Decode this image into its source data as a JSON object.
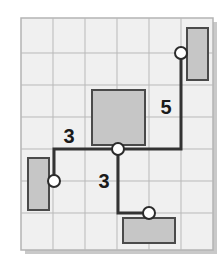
{
  "figure": {
    "type": "diagram",
    "width": 223,
    "height": 257
  },
  "colors": {
    "page_background": "#ffffff",
    "panel_background": "#f0f0f0",
    "panel_border": "#b4b4b4",
    "panel_shadow": "#c9c9c9",
    "grid_line": "#b9b9b9",
    "block_fill": "#c6c6c6",
    "block_border": "#4a4a4a",
    "path_stroke": "#333333",
    "node_fill": "#ffffff",
    "node_border": "#2b2b2b",
    "label_text": "#1a1a1a"
  },
  "panel": {
    "x": 21,
    "y": 18,
    "width": 192,
    "height": 232,
    "shadow_offset": 4
  },
  "grid": {
    "visible": true,
    "spacing": 32,
    "vertical_lines": [
      53,
      85,
      117,
      149,
      181
    ],
    "horizontal_lines": [
      53,
      85,
      117,
      149,
      181,
      213
    ]
  },
  "blocks": [
    {
      "name": "block-top-right",
      "x": 187,
      "y": 28,
      "width": 21,
      "height": 52
    },
    {
      "name": "block-center",
      "x": 92,
      "y": 90,
      "width": 53,
      "height": 55
    },
    {
      "name": "block-left",
      "x": 28,
      "y": 158,
      "width": 21,
      "height": 52
    },
    {
      "name": "block-bottom",
      "x": 123,
      "y": 218,
      "width": 52,
      "height": 25
    }
  ],
  "path": {
    "name": "routed-path",
    "stroke_width": 3,
    "points": [
      {
        "x": 54,
        "y": 181
      },
      {
        "x": 54,
        "y": 149
      },
      {
        "x": 118,
        "y": 149
      },
      {
        "x": 181,
        "y": 149
      },
      {
        "x": 181,
        "y": 53
      }
    ],
    "branch_points": [
      {
        "x": 118,
        "y": 149
      },
      {
        "x": 118,
        "y": 213
      },
      {
        "x": 149,
        "y": 213
      }
    ]
  },
  "nodes": [
    {
      "name": "node-left",
      "x": 54,
      "y": 181,
      "r": 6
    },
    {
      "name": "node-center",
      "x": 118,
      "y": 149,
      "r": 6
    },
    {
      "name": "node-top-right",
      "x": 181,
      "y": 53,
      "r": 6
    },
    {
      "name": "node-bottom",
      "x": 149,
      "y": 213,
      "r": 6
    }
  ],
  "labels": [
    {
      "name": "edge-label-left",
      "text": "3",
      "x": 69,
      "y": 143,
      "anchor": "middle"
    },
    {
      "name": "edge-label-down",
      "text": "3",
      "x": 104,
      "y": 188,
      "anchor": "middle"
    },
    {
      "name": "edge-label-right",
      "text": "5",
      "x": 166,
      "y": 114,
      "anchor": "middle"
    }
  ]
}
